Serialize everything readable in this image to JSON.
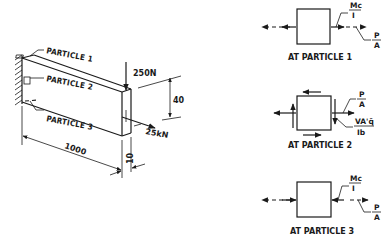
{
  "figure": {
    "beam": {
      "particles": [
        "PARTICLE 1",
        "PARTICLE 2",
        "PARTICLE 3"
      ],
      "loads": {
        "vertical": "250N",
        "axial": "25kN"
      },
      "dimensions": {
        "length": "1000",
        "height": "40",
        "thickness": "10"
      }
    },
    "elements": [
      {
        "caption": "AT PARTICLE 1",
        "bending": {
          "num": "Mc",
          "den": "I"
        },
        "axial": {
          "num": "P",
          "den": "A"
        }
      },
      {
        "caption": "AT PARTICLE 2",
        "axial": {
          "num": "P",
          "den": "A"
        },
        "shear": {
          "num": "VA'q̄",
          "den": "Ib"
        }
      },
      {
        "caption": "AT PARTICLE 3",
        "bending": {
          "num": "Mc",
          "den": "I"
        },
        "axial": {
          "num": "P",
          "den": "A"
        }
      }
    ]
  }
}
